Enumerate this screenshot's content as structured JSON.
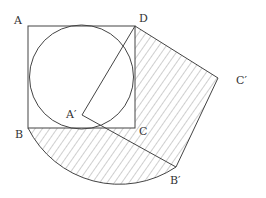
{
  "diagram": {
    "labels": {
      "A": "A",
      "B": "B",
      "C": "C",
      "D": "D",
      "A_prime": "A′",
      "B_prime": "B′",
      "C_prime": "C′"
    },
    "colors": {
      "line": "#444444",
      "hatch": "#888888",
      "background": "#ffffff"
    }
  }
}
